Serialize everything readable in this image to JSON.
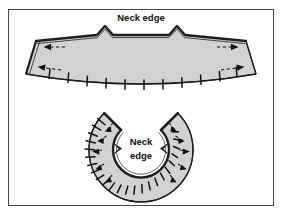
{
  "figure": {
    "kind": "sewing-pattern-diagram",
    "frame_border_color": "#4a4a4a",
    "background_color": "#ffffff",
    "piece_fill_color": "#d2d2d2",
    "outline_color": "#1a1a1a",
    "labels": {
      "top_label": "Neck edge",
      "bottom_label_line1": "Neck",
      "bottom_label_line2": "edge"
    },
    "pieces": [
      {
        "name": "flat-collar-piece",
        "shape": "wide shallow arc band with two V notches on the upper neck edge",
        "notch_count": 2,
        "clip_mark_count": 11,
        "arrow_count": 4
      },
      {
        "name": "curved-collar-piece",
        "shape": "C-shaped horseshoe annulus open at top",
        "clip_mark_count": 24,
        "notch_count": 2,
        "arrow_count": 10
      }
    ]
  }
}
